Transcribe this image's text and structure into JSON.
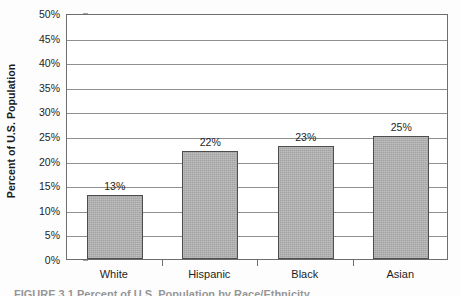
{
  "chart_data": {
    "type": "bar",
    "title": "",
    "subtitle": "",
    "xlabel": "",
    "ylabel": "Percent of U.S. Population",
    "categories": [
      "White",
      "Hispanic",
      "Black",
      "Asian"
    ],
    "values": [
      13,
      22,
      23,
      25
    ],
    "data_labels": [
      "13%",
      "22%",
      "23%",
      "25%"
    ],
    "ylim": [
      0,
      50
    ],
    "ytick_values": [
      0,
      5,
      10,
      15,
      20,
      25,
      30,
      35,
      40,
      45,
      50
    ],
    "ytick_labels": [
      "0%",
      "5%",
      "10%",
      "15%",
      "20%",
      "25%",
      "30%",
      "35%",
      "40%",
      "45%",
      "50%"
    ],
    "grid": "horizontal",
    "legend": "none",
    "series": [
      {
        "name": "Percent of U.S. Population",
        "values": [
          13,
          22,
          23,
          25
        ]
      }
    ],
    "colors": {
      "bar_fill": "#a9a9a9",
      "bar_border": "#4d4d4d",
      "gridline": "#8f8f8f",
      "axis": "#6e6e6e",
      "text": "#1d1d1d",
      "background": "#ffffff"
    }
  },
  "caption": {
    "text": "FIGURE 3.1  Percent of U.S. Population by Race/Ethnicity"
  }
}
